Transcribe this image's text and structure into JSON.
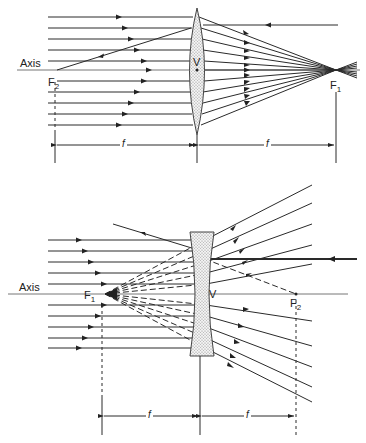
{
  "figure": {
    "colors": {
      "line": "#2a2a2a",
      "axis": "#777777",
      "lens_fill": "#e8e8e8",
      "background": "#ffffff"
    },
    "converging": {
      "axis_label": "Axis",
      "vertex_label": "V",
      "focal_left_label": "F",
      "focal_left_sub": "2",
      "focal_right_label": "F",
      "focal_right_sub": "1",
      "dim_left_label": "f",
      "dim_right_label": "f"
    },
    "diverging": {
      "axis_label": "Axis",
      "vertex_label": "V",
      "focal_left_label": "F",
      "focal_left_sub": "1",
      "focal_right_label": "F",
      "focal_right_sub": "2",
      "dim_left_label": "f",
      "dim_right_label": "f"
    }
  }
}
